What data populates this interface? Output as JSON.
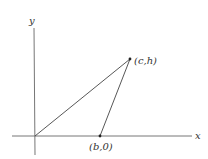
{
  "diagram": {
    "type": "triangle-in-coordinate-plane",
    "axes": {
      "x_label": "x",
      "y_label": "y",
      "color": "#555555"
    },
    "points": [
      {
        "id": "origin",
        "label": ""
      },
      {
        "id": "apex",
        "label": "(c,h)"
      },
      {
        "id": "base",
        "label": "(b,0)"
      }
    ],
    "edges": [
      {
        "from": "origin",
        "to": "apex"
      },
      {
        "from": "apex",
        "to": "base"
      },
      {
        "from": "origin",
        "to": "base"
      }
    ],
    "line_color": "#444444"
  }
}
